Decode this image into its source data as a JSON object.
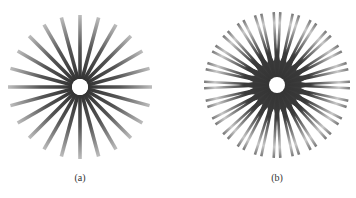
{
  "figure": {
    "panels": [
      {
        "id": "a",
        "caption": "(a)",
        "description": "Siemens star with single spokes",
        "center": [
          80,
          87
        ],
        "outer_radius": 72,
        "inner_radius": 8,
        "spokes": 24,
        "style": "single"
      },
      {
        "id": "b",
        "caption": "(b)",
        "description": "Star with paired spokes and dark central ring",
        "center": [
          277,
          85
        ],
        "outer_radius": 73,
        "inner_radius": 8,
        "ring_radius": 30,
        "spokes": 24,
        "style": "paired"
      }
    ],
    "colors": {
      "spoke_dark": "#2a2a2a",
      "spoke_light": "#bdbdbd",
      "background": "#ffffff"
    }
  }
}
